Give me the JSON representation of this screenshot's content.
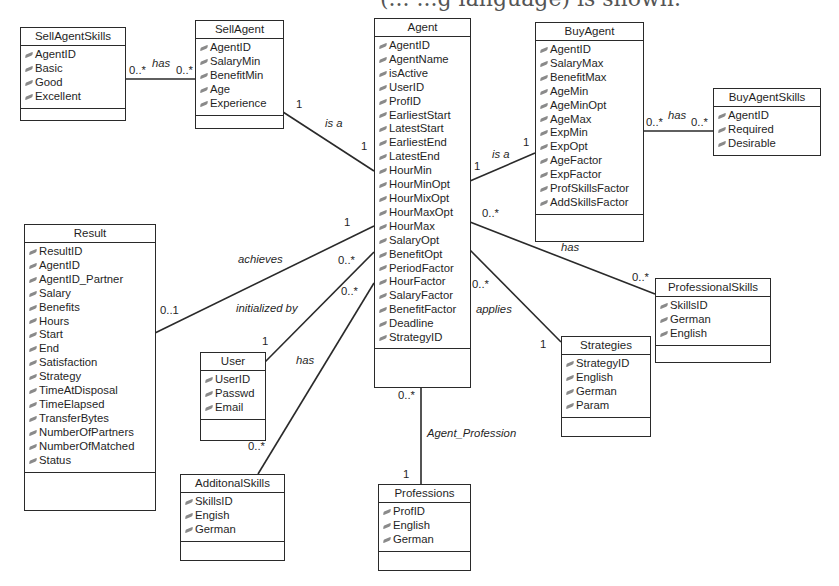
{
  "caption_fragment": "(... ...g language) is shown.",
  "classes": {
    "sellAgentSkills": {
      "name": "SellAgentSkills",
      "attributes": [
        "AgentID",
        "Basic",
        "Good",
        "Excellent"
      ]
    },
    "sellAgent": {
      "name": "SellAgent",
      "attributes": [
        "AgentID",
        "SalaryMin",
        "BenefitMin",
        "Age",
        "Experience"
      ]
    },
    "agent": {
      "name": "Agent",
      "attributes": [
        "AgentID",
        "AgentName",
        "isActive",
        "UserID",
        "ProfID",
        "EarliestStart",
        "LatestStart",
        "EarliestEnd",
        "LatestEnd",
        "HourMin",
        "HourMinOpt",
        "HourMixOpt",
        "HourMaxOpt",
        "HourMax",
        "SalaryOpt",
        "BenefitOpt",
        "PeriodFactor",
        "HourFactor",
        "SalaryFactor",
        "BenefitFactor",
        "Deadline",
        "StrategyID"
      ]
    },
    "buyAgent": {
      "name": "BuyAgent",
      "attributes": [
        "AgentID",
        "SalaryMax",
        "BenefitMax",
        "AgeMin",
        "AgeMinOpt",
        "AgeMax",
        "ExpMin",
        "ExpOpt",
        "AgeFactor",
        "ExpFactor",
        "ProfSkillsFactor",
        "AddSkillsFactor"
      ]
    },
    "buyAgentSkills": {
      "name": "BuyAgentSkills",
      "attributes": [
        "AgentID",
        "Required",
        "Desirable"
      ]
    },
    "result": {
      "name": "Result",
      "attributes": [
        "ResultID",
        "AgentID",
        "AgentID_Partner",
        "Salary",
        "Benefits",
        "Hours",
        "Start",
        "End",
        "Satisfaction",
        "Strategy",
        "TimeAtDisposal",
        "TimeElapsed",
        "TransferBytes",
        "NumberOfPartners",
        "NumberOfMatched",
        "Status"
      ]
    },
    "user": {
      "name": "User",
      "attributes": [
        "UserID",
        "Passwd",
        "Email"
      ]
    },
    "additonalSkills": {
      "name": "AdditonalSkills",
      "attributes": [
        "SkillsID",
        "Engish",
        "German"
      ]
    },
    "professions": {
      "name": "Professions",
      "attributes": [
        "ProfID",
        "English",
        "German"
      ]
    },
    "strategies": {
      "name": "Strategies",
      "attributes": [
        "StrategyID",
        "English",
        "German",
        "Param"
      ]
    },
    "professionalSkills": {
      "name": "ProfessionalSkills",
      "attributes": [
        "SkillsID",
        "German",
        "English"
      ]
    }
  },
  "associations": {
    "sellSkills": {
      "label": "has",
      "from_mult": "0..*",
      "to_mult": "0..*"
    },
    "sellIsA": {
      "label": "is a",
      "from_mult": "1",
      "to_mult": "1"
    },
    "buyIsA": {
      "label": "is a",
      "from_mult": "1",
      "to_mult": "1"
    },
    "buySkills": {
      "label": "has",
      "from_mult": "0..*",
      "to_mult": "0..*"
    },
    "achieves": {
      "label": "achieves",
      "agent_mult": "1",
      "result_mult": "0..1"
    },
    "initializedBy": {
      "label": "initialized by",
      "agent_mult": "0..*",
      "user_mult": "1"
    },
    "hasAdditional": {
      "label": "has",
      "agent_mult": "0..*",
      "skills_mult": "0..*"
    },
    "hasProfessional": {
      "label": "has",
      "agent_mult": "0..*",
      "skills_mult": "0..*"
    },
    "applies": {
      "label": "applies",
      "agent_mult": "0..*",
      "strategy_mult": "1"
    },
    "agentProfession": {
      "label": "Agent_Profession",
      "agent_mult": "0..*",
      "profession_mult": "1"
    }
  }
}
